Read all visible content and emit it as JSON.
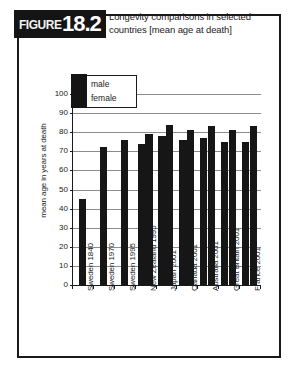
{
  "figure": {
    "badge_word": "FIGURE",
    "badge_number": "18.2",
    "title": "Longevity comparisons in selected countries [mean age at death]"
  },
  "colors": {
    "bar": "#161616",
    "badge_background": "#141414",
    "border": "#1a1a1a",
    "gridline": "#8c8c8c",
    "background": "#ffffff"
  },
  "legend": {
    "items": [
      {
        "label": "male",
        "color": "#161616"
      },
      {
        "label": "female",
        "color": "#161616"
      }
    ]
  },
  "chart_data": {
    "type": "bar",
    "title": "Longevity comparisons in selected countries [mean age at death]",
    "xlabel": "",
    "ylabel": "mean age in years at death",
    "ylim": [
      0,
      100
    ],
    "ytick_labels": [
      "0",
      "10",
      "20",
      "30",
      "40",
      "50",
      "60",
      "70",
      "80",
      "90",
      "100"
    ],
    "yticks": [
      0,
      10,
      20,
      30,
      40,
      50,
      60,
      70,
      80,
      90,
      100
    ],
    "grid": true,
    "legend_position": "upper left",
    "categories": [
      "Sweden 1840",
      "Sweden 1970",
      "Sweden 1995",
      "New Zealand 1995",
      "Japan 2001",
      "Canada 2001",
      "Australia 2001",
      "Great Britain 2001",
      "France 2001"
    ],
    "series": [
      {
        "name": "male",
        "values": [
          45,
          72,
          76,
          74,
          78,
          76,
          77,
          75,
          75
        ]
      },
      {
        "name": "female",
        "values": [
          null,
          null,
          null,
          79,
          84,
          81,
          83,
          81,
          83
        ]
      }
    ]
  }
}
